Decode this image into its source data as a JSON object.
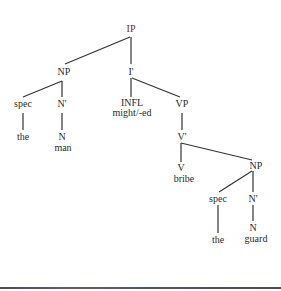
{
  "tree": {
    "root": {
      "label": "IP"
    },
    "subject_np": {
      "label": "NP",
      "spec": "spec",
      "spec_word": "the",
      "nbar": "N'",
      "n": "N",
      "n_word": "man"
    },
    "ibar": {
      "label": "I'"
    },
    "infl": {
      "label": "INFL",
      "word": "might/-ed"
    },
    "vp": {
      "label": "VP"
    },
    "vbar": {
      "label": "V'"
    },
    "v": {
      "label": "V",
      "word": "bribe"
    },
    "object_np": {
      "label": "NP",
      "spec": "spec",
      "spec_word": "the",
      "nbar": "N'",
      "n": "N",
      "n_word": "guard"
    }
  },
  "colors": {
    "text": "#2a2a2a",
    "line": "#333333",
    "root_label": "#6a2a2a"
  }
}
